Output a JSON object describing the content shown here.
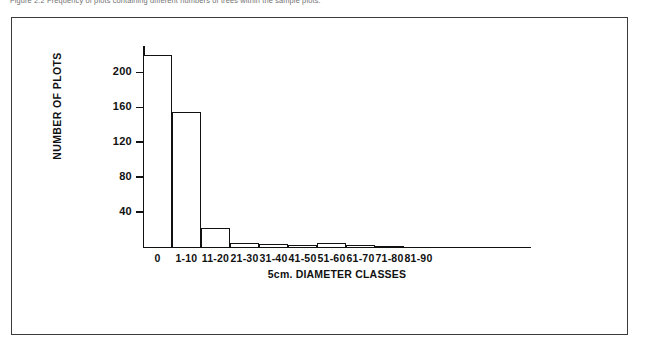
{
  "caption": {
    "text": "Figure 2.2  Frequency of plots containing different numbers of trees within the sample plots."
  },
  "chart_data": {
    "type": "bar",
    "title": "",
    "subtitle": "",
    "xlabel": "5cm. DIAMETER CLASSES",
    "ylabel": "NUMBER OF PLOTS",
    "categories": [
      "0",
      "1-10",
      "11-20",
      "21-30",
      "31-40",
      "41-50",
      "51-60",
      "61-70",
      "71-80",
      "81-90"
    ],
    "values": [
      220,
      154,
      22,
      5,
      3,
      2,
      5,
      2,
      1,
      0
    ],
    "ylim": [
      0,
      230
    ],
    "yticks": [
      40,
      80,
      120,
      160,
      200
    ],
    "ytick_labels": [
      "40",
      "80",
      "120",
      "160",
      "200"
    ],
    "grid": false,
    "legend": null,
    "bar_fill": "#ffffff",
    "bar_edge": "#111111",
    "axis_color": "#111111"
  }
}
